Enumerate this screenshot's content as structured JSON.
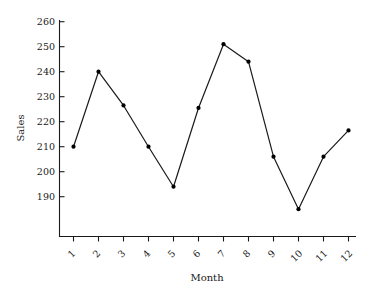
{
  "chart_data": {
    "type": "line",
    "title": "",
    "subtitle": "",
    "xlabel": "Month",
    "ylabel": "Sales",
    "categories": [
      "1",
      "2",
      "3",
      "4",
      "5",
      "6",
      "7",
      "8",
      "9",
      "10",
      "11",
      "12"
    ],
    "x": [
      1,
      2,
      3,
      4,
      5,
      6,
      7,
      8,
      9,
      10,
      11,
      12
    ],
    "values": [
      210,
      240,
      226.5,
      210,
      194,
      225.5,
      251,
      244,
      206,
      185,
      206,
      216.5
    ],
    "series": [
      {
        "name": "Sales",
        "values": [
          210,
          240,
          226.5,
          210,
          194,
          225.5,
          251,
          244,
          206,
          185,
          206,
          216.5
        ]
      }
    ],
    "ylim": [
      182,
      263
    ],
    "xlim": [
      0.4,
      12.6
    ],
    "yticks": [
      190,
      200,
      210,
      220,
      230,
      240,
      250,
      260
    ],
    "ytick_labels": [
      "190",
      "200",
      "210",
      "220",
      "230",
      "240",
      "250",
      "260"
    ],
    "xticks": [
      1,
      2,
      3,
      4,
      5,
      6,
      7,
      8,
      9,
      10,
      11,
      12
    ],
    "xtick_labels": [
      "1",
      "2",
      "3",
      "4",
      "5",
      "6",
      "7",
      "8",
      "9",
      "10",
      "11",
      "12"
    ],
    "xtick_label_rotation": 45,
    "grid": false,
    "legend": false,
    "legend_position": "none",
    "marker": "circle",
    "line_color": "#1a1a1a",
    "marker_color": "#000000",
    "background_color": "#ffffff"
  }
}
